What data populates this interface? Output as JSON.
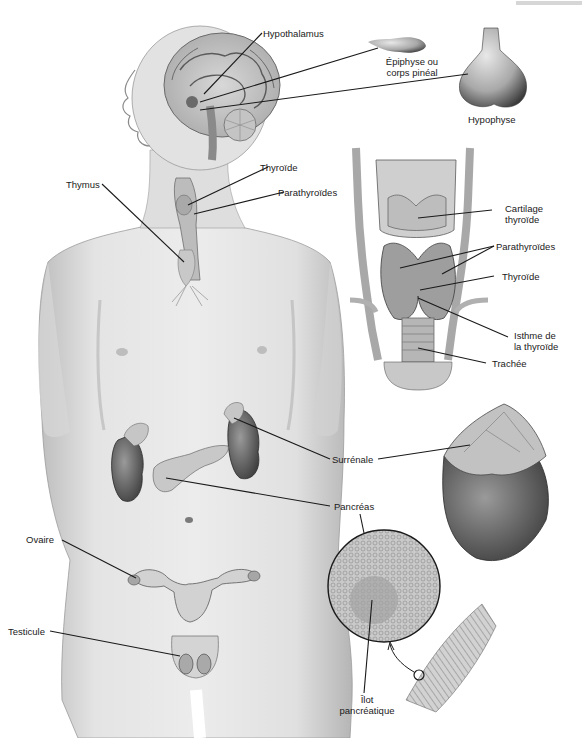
{
  "figure": {
    "title": "",
    "header_fragment": "",
    "labels": {
      "hypothalamus": "Hypothalamus",
      "epiphyse_line1": "Épiphyse ou",
      "epiphyse_line2": "corps pinéal",
      "hypophyse": "Hypophyse",
      "thymus": "Thymus",
      "thyroide_body": "Thyroïde",
      "parathyroides_body": "Parathyroïdes",
      "cartilage_line1": "Cartilage",
      "cartilage_line2": "thyroïde",
      "parathyroides_detail": "Parathyroïdes",
      "thyroide_detail": "Thyroïde",
      "isthme_line1": "Isthme de",
      "isthme_line2": "la thyroïde",
      "trachee": "Trachée",
      "surrenale": "Surrénale",
      "pancreas": "Pancréas",
      "ovaire": "Ovaire",
      "testicule": "Testicule",
      "ilot_line1": "Îlot",
      "ilot_line2": "pancréatique"
    },
    "colors": {
      "ink": "#1a1a1a",
      "skin_light": "#e6e6e6",
      "skin_mid": "#c9c9c9",
      "skin_dark": "#8f8f8f",
      "organ_dark": "#5a5a5a",
      "background": "#ffffff"
    }
  }
}
